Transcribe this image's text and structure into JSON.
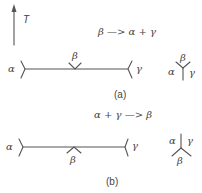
{
  "axis": {
    "label": "T",
    "direction": "up"
  },
  "panel_a": {
    "reaction": "β —> α + γ",
    "caption": "(a)",
    "left_phase": "α",
    "middle_phase": "β",
    "right_phase": "γ",
    "junction": {
      "top": "β",
      "left": "α",
      "right": "γ"
    }
  },
  "panel_b": {
    "reaction": "α + γ —> β",
    "caption": "(b)",
    "left_phase": "α",
    "middle_phase": "β",
    "right_phase": "γ",
    "junction": {
      "left": "α",
      "right": "γ",
      "bottom": "β"
    }
  },
  "colors": {
    "line": "#555555",
    "text": "#444444",
    "background": "#ffffff"
  }
}
